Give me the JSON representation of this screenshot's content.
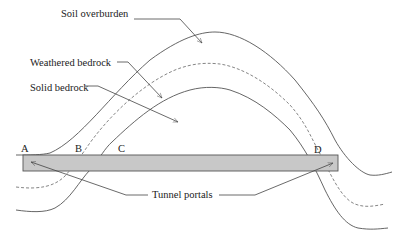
{
  "diagram": {
    "labels": {
      "soil": "Soil overburden",
      "weathered": "Weathered bedrock",
      "solid": "Solid bedrock",
      "portals": "Tunnel portals"
    },
    "points": {
      "a": "A",
      "b": "B",
      "c": "C",
      "d": "D"
    },
    "colors": {
      "tunnel_fill": "#c8c8c8",
      "line": "#555555",
      "background": "#ffffff"
    }
  }
}
